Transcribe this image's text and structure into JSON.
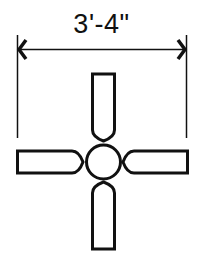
{
  "diagram": {
    "dimension": {
      "label": "3'-4\"",
      "meaning": "overall blade span (40 inches)"
    },
    "components": {
      "hub": "center circle (motor housing)",
      "blades": [
        "top",
        "right",
        "bottom",
        "left"
      ],
      "blade_count": 4
    },
    "colors": {
      "stroke": "#111111",
      "background": "#ffffff"
    }
  }
}
